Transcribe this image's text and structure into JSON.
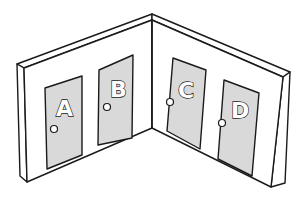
{
  "illustration": {
    "subject": "corner of two walls with four doors",
    "colors": {
      "door": "#d9d9d9",
      "wall": "#ffffff",
      "outline": "#1a1a1a"
    },
    "doors": [
      {
        "label": "A",
        "wall": "left"
      },
      {
        "label": "B",
        "wall": "left"
      },
      {
        "label": "C",
        "wall": "right"
      },
      {
        "label": "D",
        "wall": "right"
      }
    ]
  }
}
